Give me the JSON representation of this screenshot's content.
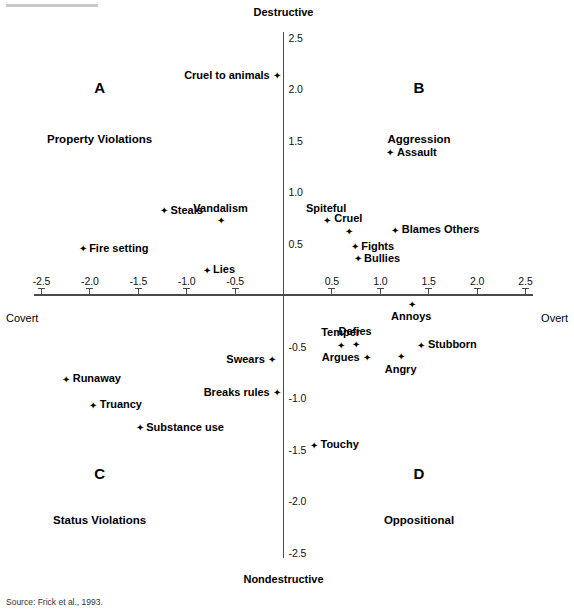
{
  "figure": {
    "source_note": "Source: Frick et al., 1993."
  },
  "chart_data": {
    "type": "scatter",
    "title": "",
    "xlabel": "",
    "ylabel": "",
    "xlim": [
      -2.5,
      2.5
    ],
    "ylim": [
      -2.5,
      2.5
    ],
    "grid": false,
    "legend": "none",
    "axis_poles": {
      "top": "Destructive",
      "bottom": "Nondestructive",
      "left": "Covert",
      "right": "Overt"
    },
    "xticks": [
      -2.5,
      -2.0,
      -1.5,
      -1.0,
      -0.5,
      0.5,
      1.0,
      1.5,
      2.0,
      2.5
    ],
    "xticklabels": [
      "-2.5",
      "-2.0",
      "-1.5",
      "-1.0",
      "-0.5",
      "0.5",
      "1.0",
      "1.5",
      "2.0",
      "2.5"
    ],
    "yticks": [
      2.5,
      2.0,
      1.5,
      1.0,
      0.5,
      -0.5,
      -1.0,
      -1.5,
      -2.0,
      -2.5
    ],
    "yticklabels": [
      "2.5",
      "2.0",
      "1.5",
      "1.0",
      "0.5",
      "-0.5",
      "-1.0",
      "-1.5",
      "-2.0",
      "-2.5"
    ],
    "quadrants": [
      {
        "letter": "A",
        "name": "Property Violations",
        "lx": -1.9,
        "ly": 2.0,
        "nx": -1.9,
        "ly2": 1.5
      },
      {
        "letter": "B",
        "name": "Aggression",
        "lx": 1.4,
        "ly": 2.0,
        "nx": 1.4,
        "ly2": 1.5
      },
      {
        "letter": "C",
        "name": "Status Violations",
        "lx": -1.9,
        "ly": -1.75,
        "nx": -1.9,
        "ly2": -2.2
      },
      {
        "letter": "D",
        "name": "Oppositional",
        "lx": 1.4,
        "ly": -1.75,
        "nx": 1.4,
        "ly2": -2.2
      }
    ],
    "points": [
      {
        "label": "Cruel to animals",
        "x": -0.07,
        "y": 2.13,
        "pos": "left"
      },
      {
        "label": "Assault",
        "x": 1.1,
        "y": 1.38,
        "pos": "right"
      },
      {
        "label": "Steals",
        "x": -1.24,
        "y": 0.82,
        "pos": "right"
      },
      {
        "label": "Vandalism",
        "x": -0.65,
        "y": 0.72,
        "pos": "above"
      },
      {
        "label": "Spiteful",
        "x": 0.44,
        "y": 0.72,
        "pos": "above"
      },
      {
        "label": "Cruel",
        "x": 0.67,
        "y": 0.62,
        "pos": "above"
      },
      {
        "label": "Blames Others",
        "x": 1.15,
        "y": 0.63,
        "pos": "right"
      },
      {
        "label": "Fire setting",
        "x": -2.08,
        "y": 0.45,
        "pos": "right"
      },
      {
        "label": "Fights",
        "x": 0.73,
        "y": 0.47,
        "pos": "right"
      },
      {
        "label": "Bullies",
        "x": 0.76,
        "y": 0.35,
        "pos": "right"
      },
      {
        "label": "Lies",
        "x": -0.8,
        "y": 0.24,
        "pos": "right"
      },
      {
        "label": "Annoys",
        "x": 1.32,
        "y": -0.09,
        "pos": "below"
      },
      {
        "label": "Temper",
        "x": 0.59,
        "y": -0.49,
        "pos": "above"
      },
      {
        "label": "Defies",
        "x": 0.74,
        "y": -0.48,
        "pos": "above"
      },
      {
        "label": "Stubborn",
        "x": 1.42,
        "y": -0.49,
        "pos": "right"
      },
      {
        "label": "Swears",
        "x": -0.12,
        "y": -0.63,
        "pos": "left"
      },
      {
        "label": "Argues",
        "x": 0.86,
        "y": -0.61,
        "pos": "left"
      },
      {
        "label": "Angry",
        "x": 1.21,
        "y": -0.6,
        "pos": "below"
      },
      {
        "label": "Runaway",
        "x": -2.25,
        "y": -0.82,
        "pos": "right"
      },
      {
        "label": "Breaks rules",
        "x": -0.07,
        "y": -0.95,
        "pos": "left"
      },
      {
        "label": "Truancy",
        "x": -1.97,
        "y": -1.07,
        "pos": "right"
      },
      {
        "label": "Substance use",
        "x": -1.49,
        "y": -1.29,
        "pos": "right"
      },
      {
        "label": "Touchy",
        "x": 0.31,
        "y": -1.46,
        "pos": "right"
      }
    ]
  }
}
